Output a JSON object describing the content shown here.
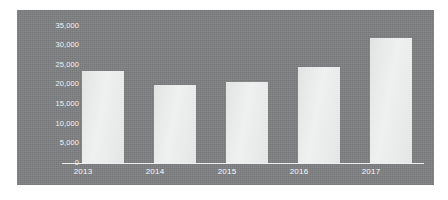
{
  "chart_data": {
    "type": "bar",
    "title": "",
    "subtitle": "",
    "xlabel": "",
    "ylabel": "",
    "categories": [
      "2013",
      "2014",
      "2015",
      "2016",
      "2017"
    ],
    "values": [
      23400,
      19900,
      20600,
      24400,
      31800
    ],
    "series": [
      {
        "name": "",
        "values": [
          23400,
          19900,
          20600,
          24400,
          31800
        ]
      }
    ],
    "ylim": [
      0,
      35000
    ],
    "y_ticks": [
      0,
      5000,
      10000,
      15000,
      20000,
      25000,
      30000,
      35000
    ],
    "y_tick_labels": [
      "0",
      "5,000",
      "10,000",
      "15,000",
      "20,000",
      "25,000",
      "30,000",
      "35,000"
    ],
    "grid": false,
    "legend": null,
    "legend_position": "none",
    "annotations": []
  },
  "style": {
    "panel_background": "#7f8081",
    "page_background": "#ffffff",
    "bar_color": "#e9eaea",
    "axis_color": "#f0f0f0",
    "tick_label_color": "#f2f2f2"
  }
}
